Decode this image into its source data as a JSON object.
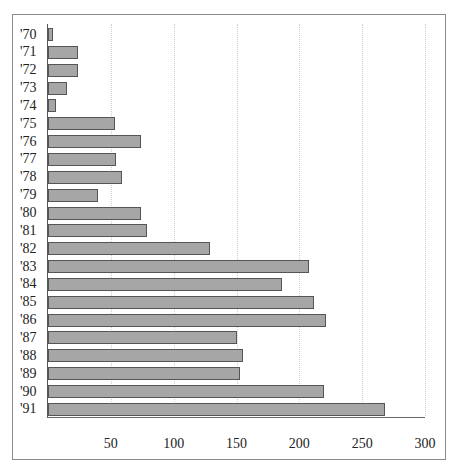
{
  "chart_data": {
    "type": "bar",
    "orientation": "horizontal",
    "title": "",
    "xlabel": "",
    "ylabel": "",
    "categories": [
      "'70",
      "'71",
      "'72",
      "'73",
      "'74",
      "'75",
      "'76",
      "'77",
      "'78",
      "'79",
      "'80",
      "'81",
      "'82",
      "'83",
      "'84",
      "'85",
      "'86",
      "'87",
      "'88",
      "'89",
      "'90",
      "'91"
    ],
    "values": [
      4,
      24,
      24,
      15,
      6,
      53,
      74,
      54,
      59,
      40,
      74,
      79,
      129,
      208,
      186,
      212,
      221,
      150,
      155,
      153,
      220,
      268
    ],
    "xlim": [
      0,
      300
    ],
    "x_ticks": [
      50,
      100,
      150,
      200,
      250,
      300
    ],
    "x_tick_labels": [
      "50",
      "100",
      "150",
      "200",
      "250",
      "300"
    ],
    "grid": "vertical dotted",
    "legend": null,
    "colors": {
      "bar_fill": "#a6a6a6",
      "bar_border": "#555555",
      "frame": "#8a8a8a"
    }
  }
}
